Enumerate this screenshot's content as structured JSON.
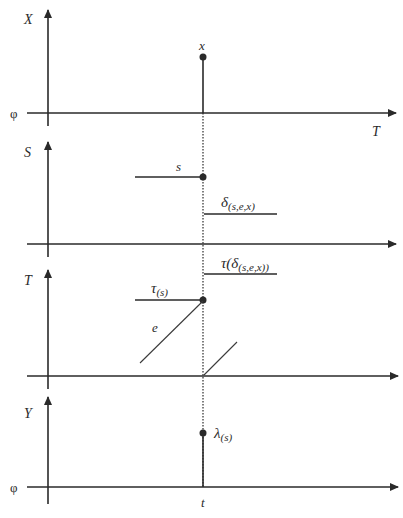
{
  "panels": {
    "x": {
      "axis_label": "X",
      "origin_label": "φ",
      "time_label": "T",
      "point_label": "x"
    },
    "s": {
      "axis_label": "S",
      "before_label": "s",
      "after_label": "δ",
      "after_sub": "(s,e,x)"
    },
    "t": {
      "axis_label": "T",
      "before_label": "τ",
      "before_sub": "(s)",
      "after_label": "τ(δ",
      "after_sub": "(s,e,x))",
      "elapsed_label": "e"
    },
    "y": {
      "axis_label": "Y",
      "origin_label": "φ",
      "point_label": "λ",
      "point_sub": "(s)",
      "time_label": "t"
    }
  },
  "colors": {
    "ink": "#2a2a2a",
    "background": "#ffffff"
  }
}
